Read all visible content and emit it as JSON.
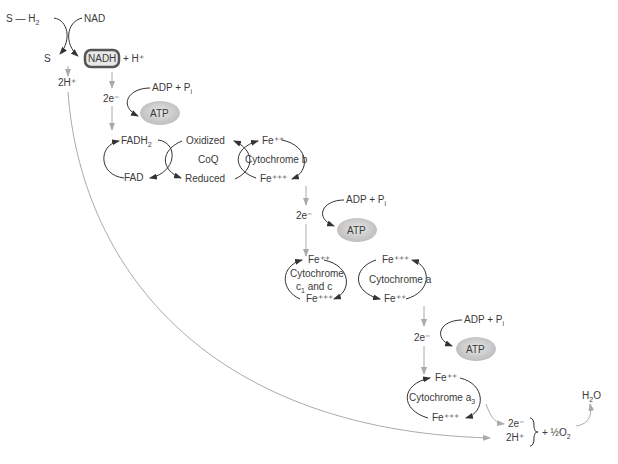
{
  "diagram": {
    "title_partial": "...Respiration: Energy...",
    "substrate": {
      "reduced": "S — H",
      "reduced_sub": "2",
      "oxidized": "S"
    },
    "nad": {
      "oxidized": "NAD",
      "reduced": "NADH",
      "proton": "+ H⁺"
    },
    "protons_top": "2H⁺",
    "electrons_label": "2e⁻",
    "atp_sites": [
      {
        "input": "ADP + P",
        "input_sub": "i",
        "output": "ATP"
      },
      {
        "input": "ADP + P",
        "input_sub": "i",
        "output": "ATP"
      },
      {
        "input": "ADP + P",
        "input_sub": "i",
        "output": "ATP"
      }
    ],
    "fad": {
      "reduced": "FADH",
      "reduced_sub": "2",
      "oxidized": "FAD"
    },
    "coq": {
      "name": "CoQ",
      "oxidized": "Oxidized",
      "reduced": "Reduced"
    },
    "cyt_b": {
      "name": "Cytochrome b",
      "top": "Fe⁺⁺",
      "bottom": "Fe⁺⁺⁺"
    },
    "cyt_c": {
      "name_line1": "Cytochrome",
      "name_line2_a": "c",
      "name_line2_sub": "1",
      "name_line2_b": " and c",
      "top": "Fe⁺⁺",
      "bottom": "Fe⁺⁺⁺"
    },
    "cyt_a": {
      "name": "Cytochrome a",
      "top": "Fe⁺⁺⁺",
      "bottom": "Fe⁺⁺"
    },
    "cyt_a3": {
      "name": "Cytochrome a",
      "name_sub": "3",
      "top": "Fe⁺⁺",
      "bottom": "Fe⁺⁺⁺"
    },
    "final": {
      "electrons": "2e⁻",
      "protons": "2H⁺",
      "oxygen": "+ ½O",
      "oxygen_sub": "2",
      "water": "H",
      "water_sub": "2",
      "water_tail": "O"
    },
    "colors": {
      "line_dark": "#333333",
      "line_gray": "#aaaaaa",
      "atp_fill": "#c8c8c8",
      "nadh_border": "#555555",
      "text": "#3a3a3a"
    }
  }
}
